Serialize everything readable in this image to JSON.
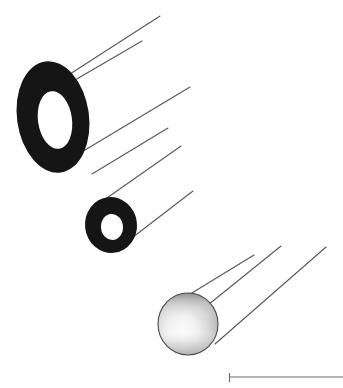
{
  "figure": {
    "title": "Tilted annuli and sphere with projection lines",
    "background_color": "#ffffff",
    "width": 343,
    "height": 388,
    "ink_color": "#1a1a1a",
    "line_color": "#555555",
    "objects": [
      {
        "name": "large-annulus",
        "type": "annulus",
        "label": "large ring",
        "fill": "#151515",
        "cx": 53,
        "cy": 117,
        "rx_outer": 36,
        "ry_outer": 56,
        "rx_inner": 17,
        "ry_inner": 29,
        "rotation_deg": -8
      },
      {
        "name": "small-annulus",
        "type": "annulus",
        "label": "small ring",
        "fill": "#151515",
        "cx": 111,
        "cy": 225,
        "rx_outer": 26,
        "ry_outer": 28,
        "rx_inner": 11,
        "ry_inner": 13,
        "rotation_deg": -6
      },
      {
        "name": "shaded-sphere",
        "type": "sphere",
        "label": "sphere",
        "outline": "#4a4a4a",
        "gradient_top": "#8d8d8d",
        "gradient_mid": "#f2f2f2",
        "gradient_bottom": "#bdbdbd",
        "cx": 188,
        "cy": 324,
        "rx": 30,
        "ry": 31
      }
    ],
    "projection_lines": [
      {
        "name": "line-large-upper-1",
        "x1": 70,
        "y1": 74,
        "x2": 160,
        "y2": 16
      },
      {
        "name": "line-large-upper-2",
        "x1": 75,
        "y1": 80,
        "x2": 142,
        "y2": 41
      },
      {
        "name": "line-large-lower-1",
        "x1": 60,
        "y1": 165,
        "x2": 190,
        "y2": 87
      },
      {
        "name": "line-large-lower-2",
        "x1": 92,
        "y1": 174,
        "x2": 168,
        "y2": 128
      },
      {
        "name": "line-small-upper",
        "x1": 104,
        "y1": 200,
        "x2": 181,
        "y2": 146
      },
      {
        "name": "line-small-lower",
        "x1": 124,
        "y1": 244,
        "x2": 193,
        "y2": 191
      },
      {
        "name": "line-sphere-upper",
        "x1": 187,
        "y1": 296,
        "x2": 254,
        "y2": 255
      },
      {
        "name": "line-sphere-middle",
        "x1": 208,
        "y1": 305,
        "x2": 281,
        "y2": 246
      },
      {
        "name": "line-sphere-lower",
        "x1": 215,
        "y1": 344,
        "x2": 326,
        "y2": 247
      }
    ],
    "scale_bar": {
      "name": "scale-bar",
      "label": "",
      "x1": 229,
      "x2": 343,
      "y": 377,
      "tick_height": 8,
      "color": "#6a6a6a"
    }
  }
}
